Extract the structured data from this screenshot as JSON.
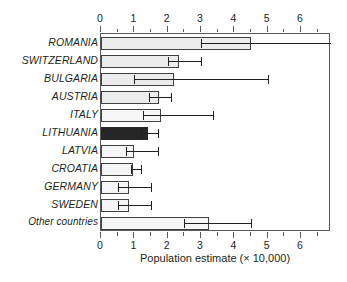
{
  "chart_data": {
    "type": "bar",
    "orientation": "horizontal",
    "title": "",
    "xlabel": "Population estimate (× 10,000)",
    "ylabel": "",
    "xlim": [
      0,
      6.9
    ],
    "xticks": [
      0,
      1,
      2,
      3,
      4,
      5,
      6
    ],
    "xtick_labels": [
      "0",
      "1",
      "2",
      "3",
      "4",
      "5",
      "6"
    ],
    "minor_tick_step": 0.5,
    "grid": false,
    "legend": "none",
    "axis_positions": [
      "top",
      "bottom"
    ],
    "categories": [
      "ROMANIA",
      "SWITZERLAND",
      "BULGARIA",
      "AUSTRIA",
      "ITALY",
      "LITHUANIA",
      "LATVIA",
      "CROATIA",
      "GERMANY",
      "SWEDEN",
      "Other countries"
    ],
    "values": [
      4.5,
      2.35,
      2.2,
      1.75,
      1.8,
      1.4,
      1.0,
      0.95,
      0.85,
      0.85,
      3.25
    ],
    "error_low": [
      3.0,
      2.0,
      1.0,
      1.45,
      1.25,
      1.2,
      0.75,
      0.9,
      0.5,
      0.5,
      2.5
    ],
    "error_high": [
      6.9,
      3.0,
      5.0,
      2.1,
      3.35,
      1.7,
      1.7,
      1.2,
      1.5,
      1.5,
      4.5
    ],
    "bar_styles": [
      "light",
      "light",
      "light",
      "light",
      "lighter",
      "dark",
      "lighter",
      "lighter",
      "lighter",
      "lighter",
      "lighter"
    ],
    "highlight_category": "LITHUANIA"
  },
  "colors": {
    "bar_light": "#ececec",
    "bar_lighter": "#f6f6f6",
    "bar_dark": "#262626",
    "bar_outline": "#414042",
    "axis": "#58595b",
    "text": "#231f20",
    "background": "#ffffff"
  }
}
